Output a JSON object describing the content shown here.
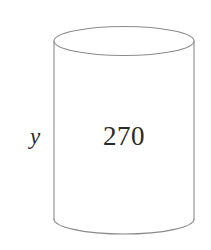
{
  "figure": {
    "name": "cylinder-diagram",
    "shape": "cylinder",
    "background_color": "#ffffff",
    "stroke_color": "#8a8a8a",
    "stroke_width": 1.1,
    "fill_color": "#ffffff",
    "geometry": {
      "left_x": 54,
      "right_x": 194,
      "top_ellipse_center_y": 41,
      "top_ellipse_rx": 70,
      "top_ellipse_ry": 14.5,
      "bottom_arc_center_y": 219,
      "bottom_arc_ry": 15,
      "body_top_y": 41,
      "body_bottom_y": 219
    }
  },
  "labels": {
    "height": {
      "text": "y",
      "semantic": "cylinder-height-variable",
      "color": "#2b2b2b",
      "style": "italic-serif",
      "font_size_px": 23,
      "x": 35,
      "y": 136
    },
    "volume": {
      "text": "270",
      "semantic": "cylinder-volume-value",
      "color": "#2a2a2a",
      "style": "serif",
      "font_size_px": 27,
      "x": 124,
      "y": 136
    }
  }
}
